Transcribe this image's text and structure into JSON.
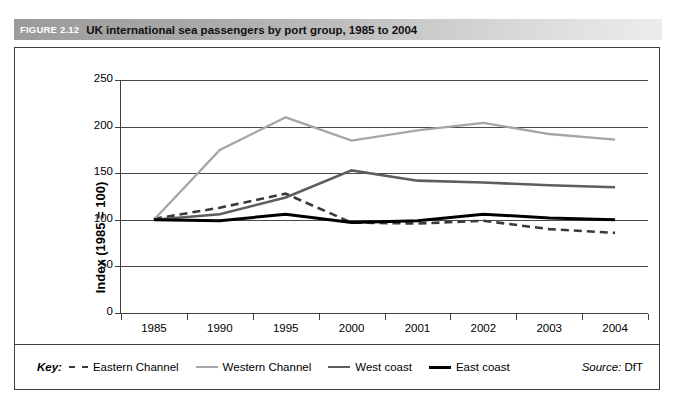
{
  "figure": {
    "number": "FIGURE 2.12",
    "title": "UK international sea passengers by port group, 1985 to 2004"
  },
  "source": {
    "label": "Source:",
    "value": "DfT"
  },
  "legend": {
    "key_label": "Key:",
    "items": [
      {
        "label": "Eastern Channel",
        "color": "#3a3a3a",
        "style": "dashed"
      },
      {
        "label": "Western Channel",
        "color": "#a6a6a6",
        "style": "solid"
      },
      {
        "label": "West coast",
        "color": "#5e5e5e",
        "style": "solid"
      },
      {
        "label": "East coast",
        "color": "#000000",
        "style": "solid"
      }
    ]
  },
  "chart_data": {
    "type": "line",
    "title": "UK international sea passengers by port group, 1985 to 2004",
    "xlabel": "",
    "ylabel": "Index (1985 = 100)",
    "categories": [
      "1985",
      "1990",
      "1995",
      "2000",
      "2001",
      "2002",
      "2003",
      "2004"
    ],
    "yticks": [
      0,
      50,
      100,
      150,
      200,
      250
    ],
    "ylim": [
      0,
      250
    ],
    "grid": true,
    "legend_position": "bottom",
    "series": [
      {
        "name": "Eastern Channel",
        "color": "#3a3a3a",
        "style": "dashed",
        "width": 2.6,
        "values": [
          101,
          113,
          128,
          97,
          96,
          99,
          90,
          86
        ]
      },
      {
        "name": "Western Channel",
        "color": "#a6a6a6",
        "style": "solid",
        "width": 2.4,
        "values": [
          100,
          175,
          210,
          185,
          196,
          204,
          192,
          186
        ]
      },
      {
        "name": "West coast",
        "color": "#5e5e5e",
        "style": "solid",
        "width": 2.6,
        "values": [
          100,
          106,
          124,
          153,
          142,
          140,
          137,
          135
        ]
      },
      {
        "name": "East coast",
        "color": "#000000",
        "style": "solid",
        "width": 3.0,
        "values": [
          100,
          99,
          106,
          97,
          99,
          106,
          102,
          100
        ]
      }
    ]
  }
}
